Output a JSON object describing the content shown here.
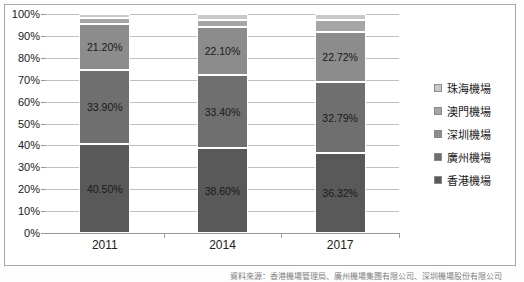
{
  "chart_data": {
    "type": "bar",
    "title": "",
    "subtitle": "",
    "xlabel": "",
    "ylabel": "",
    "categories": [
      "2011",
      "2014",
      "2017"
    ],
    "ylim": [
      0,
      100
    ],
    "ytick_labels": [
      "0%",
      "10%",
      "20%",
      "30%",
      "40%",
      "50%",
      "60%",
      "70%",
      "80%",
      "90%",
      "100%"
    ],
    "ytick_values": [
      0,
      10,
      20,
      30,
      40,
      50,
      60,
      70,
      80,
      90,
      100
    ],
    "grid": true,
    "stacked": true,
    "normalized_percent": true,
    "legend_position": "right",
    "series": [
      {
        "name": "香港機場",
        "color": "#595959",
        "values": [
          40.5,
          38.6,
          36.32
        ],
        "labels": [
          "40.50%",
          "38.60%",
          "36.32%"
        ]
      },
      {
        "name": "廣州機場",
        "color": "#6f6f6f",
        "values": [
          33.9,
          33.4,
          32.79
        ],
        "labels": [
          "33.90%",
          "33.40%",
          "32.79%"
        ]
      },
      {
        "name": "深圳機場",
        "color": "#8c8c8c",
        "values": [
          21.2,
          22.1,
          22.72
        ],
        "labels": [
          "21.20%",
          "22.10%",
          "22.72%"
        ]
      },
      {
        "name": "澳門機場",
        "color": "#a6a6a6",
        "values": [
          2.8,
          3.2,
          5.3
        ],
        "labels": [
          "",
          "",
          ""
        ]
      },
      {
        "name": "珠海機場",
        "color": "#c9c9c9",
        "values": [
          1.6,
          2.7,
          2.87
        ],
        "labels": [
          "",
          "",
          ""
        ]
      }
    ]
  },
  "legend": {
    "items": [
      {
        "label": "珠海機場",
        "color": "#c9c9c9"
      },
      {
        "label": "澳門機場",
        "color": "#a6a6a6"
      },
      {
        "label": "深圳機場",
        "color": "#8c8c8c"
      },
      {
        "label": "廣州機場",
        "color": "#6f6f6f"
      },
      {
        "label": "香港機場",
        "color": "#595959"
      }
    ]
  },
  "caption": {
    "text": "資料來源：香港機場管理局、廣州機場集團有限公司、深圳機場股份有限公司"
  }
}
